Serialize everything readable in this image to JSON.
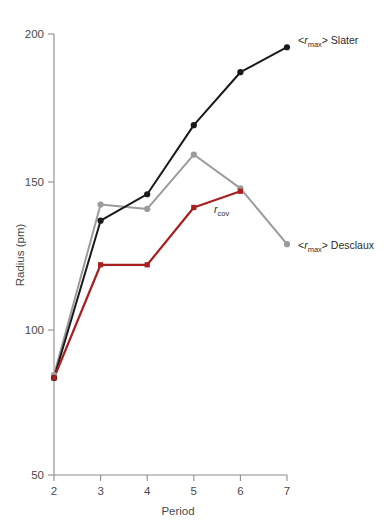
{
  "chart_data": {
    "type": "line",
    "title": "",
    "xlabel": "Period",
    "ylabel": "Radius (pm)",
    "xlim": [
      2,
      7
    ],
    "ylim": [
      50,
      200
    ],
    "xticks": [
      2,
      3,
      4,
      5,
      6,
      7
    ],
    "xtick_labels": [
      "2",
      "3",
      "4",
      "5",
      "6",
      "7"
    ],
    "yticks": [
      50,
      100,
      150,
      200
    ],
    "ytick_labels": [
      "50",
      "100",
      "150",
      "200"
    ],
    "grid": false,
    "legend_position": "inline-right-of-line-end",
    "x": [
      2,
      3,
      4,
      5,
      6,
      7
    ],
    "series": [
      {
        "name": "<rmax> Slater",
        "label_text": "> Slater",
        "label_prefix": "<",
        "label_italic": "r",
        "label_sub": "max",
        "color": "#1a1a1a",
        "marker": "circle",
        "x": [
          2,
          3,
          4,
          5,
          6,
          7
        ],
        "values": [
          83,
          136.5,
          145.5,
          169,
          187,
          195.5
        ],
        "label_x": 7,
        "label_y": 195.5
      },
      {
        "name": "<rmax> Desclaux",
        "label_text": "> Desclaux",
        "label_prefix": "<",
        "label_italic": "r",
        "label_sub": "max",
        "color": "#9b9b9b",
        "marker": "circle",
        "x": [
          2,
          3,
          4,
          5,
          6,
          7
        ],
        "values": [
          84,
          142,
          140.5,
          159,
          147.5,
          128.5
        ],
        "label_x": 7,
        "label_y": 128.5
      },
      {
        "name": "rcov",
        "label_text": "",
        "label_prefix": "",
        "label_italic": "r",
        "label_sub": "cov",
        "color": "#a81f1f",
        "marker": "square",
        "x": [
          2,
          3,
          4,
          5,
          6
        ],
        "values": [
          83,
          121.5,
          121.5,
          141,
          146.5
        ],
        "label_x": 5.45,
        "label_y": 135.5
      }
    ],
    "annotations": [
      {
        "text": "Period",
        "role": "x-axis-title"
      },
      {
        "text": "Radius (pm)",
        "role": "y-axis-title"
      }
    ],
    "colors": {
      "slater": "#1a1a1a",
      "desclaux": "#9b9b9b",
      "rcov": "#a81f1f",
      "axis": "#8c8c8c",
      "text": "#4a4a4a",
      "background": "#ffffff"
    }
  }
}
